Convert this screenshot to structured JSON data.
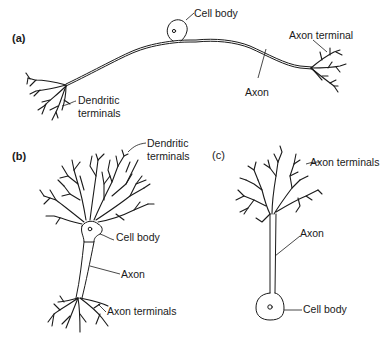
{
  "figure": {
    "panels": [
      {
        "id": "a",
        "label": "(a)",
        "labels": {
          "cell_body": "Cell body",
          "axon_terminal": "Axon terminal",
          "axon": "Axon",
          "dendritic_line1": "Dendritic",
          "dendritic_line2": "terminals"
        }
      },
      {
        "id": "b",
        "label": "(b)",
        "labels": {
          "dendritic_line1": "Dendritic",
          "dendritic_line2": "terminals",
          "cell_body": "Cell body",
          "axon": "Axon",
          "axon_terminals": "Axon terminals"
        }
      },
      {
        "id": "c",
        "label": "(c)",
        "labels": {
          "axon_terminals": "Axon terminals",
          "axon": "Axon",
          "cell_body": "Cell body"
        }
      }
    ]
  }
}
